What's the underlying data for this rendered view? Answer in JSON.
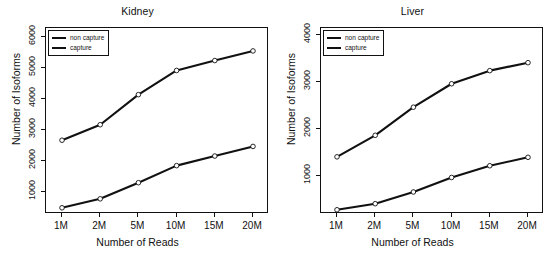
{
  "figure": {
    "panel_count": 2
  },
  "panels": [
    {
      "title": "Kidney",
      "xlabel": "Number of Reads",
      "ylabel": "Number of Isoforms",
      "xticks": [
        "1M",
        "2M",
        "5M",
        "10M",
        "15M",
        "20M"
      ],
      "yticks": [
        "1000",
        "2000",
        "3000",
        "4000",
        "5000",
        "6000"
      ],
      "legend": [
        "non capture",
        "capture"
      ]
    },
    {
      "title": "Liver",
      "xlabel": "Number of Reads",
      "ylabel": "Number of Isoforms",
      "xticks": [
        "1M",
        "2M",
        "5M",
        "10M",
        "15M",
        "20M"
      ],
      "yticks": [
        "1000",
        "2000",
        "3000",
        "4000"
      ],
      "legend": [
        "non capture",
        "capture"
      ]
    }
  ],
  "chart_data": [
    {
      "type": "line",
      "title": "Kidney",
      "xlabel": "Number of Reads",
      "ylabel": "Number of Isoforms",
      "categories": [
        "1M",
        "2M",
        "5M",
        "10M",
        "15M",
        "20M"
      ],
      "x": [
        1,
        2,
        5,
        10,
        15,
        20
      ],
      "xlim": [
        1,
        20
      ],
      "ylim": [
        300,
        6300
      ],
      "yticks": [
        1000,
        2000,
        3000,
        4000,
        5000,
        6000
      ],
      "grid": false,
      "legend_position": "top-left",
      "marker": "open-circle",
      "line_color": "#111111",
      "series": [
        {
          "name": "non capture",
          "values": [
            2680,
            3180,
            4150,
            4930,
            5250,
            5560
          ]
        },
        {
          "name": "capture",
          "values": [
            500,
            790,
            1310,
            1860,
            2170,
            2480
          ]
        }
      ]
    },
    {
      "type": "line",
      "title": "Liver",
      "xlabel": "Number of Reads",
      "ylabel": "Number of Isoforms",
      "categories": [
        "1M",
        "2M",
        "5M",
        "10M",
        "15M",
        "20M"
      ],
      "x": [
        1,
        2,
        5,
        10,
        15,
        20
      ],
      "xlim": [
        1,
        20
      ],
      "ylim": [
        180,
        4150
      ],
      "yticks": [
        1000,
        2000,
        3000,
        4000
      ],
      "grid": false,
      "legend_position": "top-left",
      "marker": "open-circle",
      "line_color": "#111111",
      "series": [
        {
          "name": "non capture",
          "values": [
            1400,
            1860,
            2460,
            2960,
            3240,
            3410
          ]
        },
        {
          "name": "capture",
          "values": [
            270,
            400,
            650,
            960,
            1210,
            1390
          ]
        }
      ]
    }
  ]
}
